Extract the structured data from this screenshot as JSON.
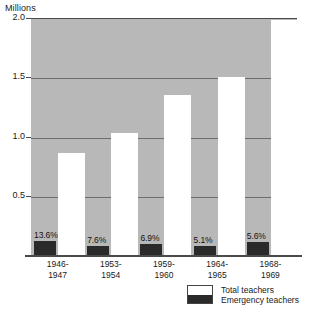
{
  "axis_title": "Millions",
  "legend": {
    "total_label": "Total teachers",
    "emergency_label": "Emergency teachers"
  },
  "colors": {
    "plot_background": "#b8b8b8",
    "total_bar": "#ffffff",
    "emergency_bar": "#2a2a2a",
    "gridline": "#6d6d6d",
    "axis": "#4a4a4a"
  },
  "chart_data": {
    "type": "bar",
    "title": "",
    "subtitle": "",
    "xlabel": "",
    "ylabel": "Millions",
    "ylim": [
      0,
      2.0
    ],
    "yticks": [
      "0.5",
      "1.0",
      "1.5",
      "2.0"
    ],
    "ytick_values": [
      0.5,
      1.0,
      1.5,
      2.0
    ],
    "grid": true,
    "legend_position": "bottom-right",
    "categories": [
      "1946-\n1947",
      "1953-\n1954",
      "1959-\n1960",
      "1964-\n1965",
      "1968-\n1969"
    ],
    "category_lines": [
      [
        "1946-",
        "1947"
      ],
      [
        "1953-",
        "1954"
      ],
      [
        "1959-",
        "1960"
      ],
      [
        "1964-",
        "1965"
      ],
      [
        "1968-",
        "1969"
      ]
    ],
    "series": [
      {
        "name": "Total teachers",
        "values": [
          0.86,
          1.03,
          1.35,
          1.5,
          1.98
        ]
      },
      {
        "name": "Emergency teachers",
        "values": [
          0.117,
          0.078,
          0.093,
          0.077,
          0.111
        ]
      }
    ],
    "annotations": [
      "13.6%",
      "7.6%",
      "6.9%",
      "5.1%",
      "5.6%"
    ]
  }
}
